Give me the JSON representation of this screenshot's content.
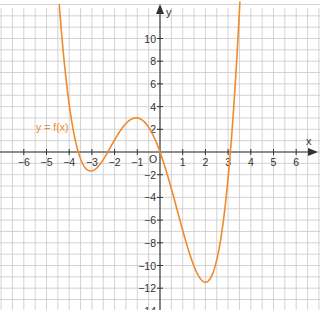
{
  "chart_data": {
    "type": "line",
    "title": "",
    "xlabel": "x",
    "ylabel": "y",
    "origin_label": "O",
    "xlim": [
      -7,
      7
    ],
    "ylim": [
      -14,
      13
    ],
    "x_ticks": [
      -6,
      -5,
      -4,
      -3,
      -2,
      -1,
      1,
      2,
      3,
      4,
      5,
      6
    ],
    "x_tick_labels": [
      "−6",
      "−5",
      "−4",
      "−3",
      "−2",
      "−1",
      "1",
      "2",
      "3",
      "4",
      "5",
      "6"
    ],
    "y_ticks": [
      10,
      8,
      6,
      4,
      2,
      -2,
      -4,
      -6,
      -8,
      -10,
      -12,
      -14
    ],
    "y_tick_labels": [
      "10",
      "8",
      "6",
      "4",
      "2",
      "−2",
      "−4",
      "−6",
      "−8",
      "−10",
      "−12",
      "−14"
    ],
    "grid": true,
    "series": [
      {
        "name": "y = f(x)",
        "color": "#f08a2c",
        "roots": [
          -3.6,
          -2.3,
          0,
          3.1
        ],
        "key_points": [
          {
            "x": -3.6,
            "y": 0
          },
          {
            "x": -3,
            "y": -2
          },
          {
            "x": -2.3,
            "y": 0
          },
          {
            "x": -1,
            "y": 3
          },
          {
            "x": 0,
            "y": 0
          },
          {
            "x": 2,
            "y": -12.7
          },
          {
            "x": 3.1,
            "y": 0
          }
        ],
        "x": [
          -4.4,
          -4,
          -3.6,
          -3.3,
          -3,
          -2.6,
          -2.3,
          -2,
          -1.5,
          -1,
          -0.5,
          0,
          0.5,
          1,
          1.5,
          2,
          2.5,
          3,
          3.1,
          3.4
        ],
        "y": [
          13.6,
          6.2,
          0,
          -1.7,
          -1.9,
          -1.3,
          0,
          1.2,
          2.8,
          3.4,
          2.4,
          0,
          -3.3,
          -7.4,
          -11.1,
          -12.9,
          -11.5,
          -1.3,
          0,
          11.1
        ]
      }
    ],
    "legend": {
      "position": "inline-left",
      "text": "y = f(x)"
    }
  },
  "colors": {
    "curve": "#f08a2c",
    "grid": "#c8c8c8",
    "axis": "#333333"
  }
}
